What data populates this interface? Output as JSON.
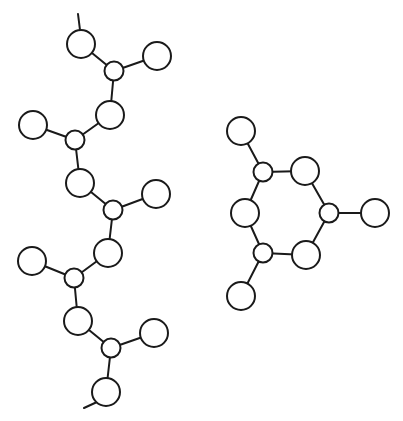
{
  "diagram": {
    "type": "molecular-structure",
    "colors": {
      "stroke": "#1a1a1a",
      "fill": "#ffffff",
      "background": "#ffffff"
    },
    "structures": [
      {
        "name": "linear-chain",
        "atoms": [
          {
            "id": "a1",
            "x": 81,
            "y": 44,
            "r": 14
          },
          {
            "id": "s1",
            "x": 114,
            "y": 71,
            "r": 9.5
          },
          {
            "id": "b1",
            "x": 157,
            "y": 56,
            "r": 14
          },
          {
            "id": "a2",
            "x": 110,
            "y": 115,
            "r": 14
          },
          {
            "id": "s2",
            "x": 75,
            "y": 140,
            "r": 9.5
          },
          {
            "id": "b2",
            "x": 33,
            "y": 125,
            "r": 14
          },
          {
            "id": "a3",
            "x": 80,
            "y": 183,
            "r": 14
          },
          {
            "id": "s3",
            "x": 113,
            "y": 210,
            "r": 9.5
          },
          {
            "id": "b3",
            "x": 156,
            "y": 194,
            "r": 14
          },
          {
            "id": "a4",
            "x": 108,
            "y": 253,
            "r": 14
          },
          {
            "id": "s4",
            "x": 74,
            "y": 278,
            "r": 9.5
          },
          {
            "id": "b4",
            "x": 32,
            "y": 261,
            "r": 14
          },
          {
            "id": "a5",
            "x": 78,
            "y": 321,
            "r": 14
          },
          {
            "id": "s5",
            "x": 111,
            "y": 348,
            "r": 9.5
          },
          {
            "id": "b5",
            "x": 154,
            "y": 333,
            "r": 14
          },
          {
            "id": "a6",
            "x": 106,
            "y": 392,
            "r": 14
          }
        ],
        "bonds": [
          [
            "a1",
            "s1"
          ],
          [
            "s1",
            "b1"
          ],
          [
            "s1",
            "a2"
          ],
          [
            "a2",
            "s2"
          ],
          [
            "s2",
            "b2"
          ],
          [
            "s2",
            "a3"
          ],
          [
            "a3",
            "s3"
          ],
          [
            "s3",
            "b3"
          ],
          [
            "s3",
            "a4"
          ],
          [
            "a4",
            "s4"
          ],
          [
            "s4",
            "b4"
          ],
          [
            "s4",
            "a5"
          ],
          [
            "a5",
            "s5"
          ],
          [
            "s5",
            "b5"
          ],
          [
            "s5",
            "a6"
          ]
        ],
        "stubs": [
          {
            "x1": 78,
            "y1": 14,
            "x2": 80,
            "y2": 30
          },
          {
            "x1": 97,
            "y1": 402,
            "x2": 84,
            "y2": 408
          }
        ]
      },
      {
        "name": "ring-structure",
        "atoms": [
          {
            "id": "r1",
            "x": 263,
            "y": 172,
            "r": 9.5
          },
          {
            "id": "r2",
            "x": 305,
            "y": 171,
            "r": 14
          },
          {
            "id": "r3",
            "x": 329,
            "y": 213,
            "r": 9.5
          },
          {
            "id": "r4",
            "x": 306,
            "y": 255,
            "r": 14
          },
          {
            "id": "r5",
            "x": 263,
            "y": 253,
            "r": 9.5
          },
          {
            "id": "r6",
            "x": 245,
            "y": 213,
            "r": 14
          },
          {
            "id": "p1",
            "x": 241,
            "y": 131,
            "r": 14
          },
          {
            "id": "p2",
            "x": 375,
            "y": 213,
            "r": 14
          },
          {
            "id": "p3",
            "x": 241,
            "y": 296,
            "r": 14
          }
        ],
        "bonds": [
          [
            "r1",
            "r2"
          ],
          [
            "r2",
            "r3"
          ],
          [
            "r3",
            "r4"
          ],
          [
            "r4",
            "r5"
          ],
          [
            "r5",
            "r6"
          ],
          [
            "r6",
            "r1"
          ],
          [
            "r1",
            "p1"
          ],
          [
            "r3",
            "p2"
          ],
          [
            "r5",
            "p3"
          ]
        ],
        "stubs": []
      }
    ]
  }
}
